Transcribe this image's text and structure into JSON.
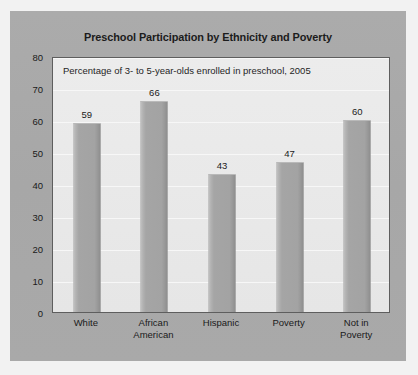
{
  "panel": {
    "background_color": "#a9a9a9"
  },
  "chart_data": {
    "type": "bar",
    "title": "Preschool Participation by Ethnicity and Poverty",
    "subtitle": "Percentage of 3- to 5-year-olds enrolled in preschool, 2005",
    "categories": [
      "White",
      "African American",
      "Hispanic",
      "Poverty",
      "Not in Poverty"
    ],
    "category_lines": [
      [
        "White"
      ],
      [
        "African",
        "American"
      ],
      [
        "Hispanic"
      ],
      [
        "Poverty"
      ],
      [
        "Not in",
        "Poverty"
      ]
    ],
    "values": [
      59,
      66,
      43,
      47,
      60
    ],
    "value_labels": [
      "59",
      "66",
      "43",
      "47",
      "60"
    ],
    "xlabel": "",
    "ylabel": "",
    "ylim": [
      0,
      80
    ],
    "ytick_values": [
      80,
      70,
      60,
      50,
      40,
      30,
      20,
      10,
      0
    ],
    "ytick_labels": [
      "80",
      "70",
      "60",
      "50",
      "40",
      "30",
      "20",
      "10",
      "0"
    ],
    "grid": true,
    "grid_axis": "y",
    "legend": false,
    "bar_color": "#a5a5a5",
    "plot_background": "#e8e8e8",
    "text_color": "#1a1a1a"
  }
}
